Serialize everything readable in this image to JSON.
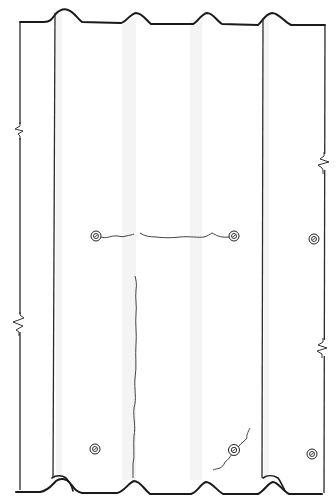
{
  "drawing": {
    "type": "corrugated sheet panel elevation",
    "colors": {
      "line": "#1a1a1a",
      "crack": "#444444",
      "shade": "#f4f4f4",
      "background": "#ffffff"
    },
    "panels": [
      {
        "name": "left-panel-edge",
        "x_left": 20,
        "x_right": 55
      },
      {
        "name": "center-panel",
        "x_left": 55,
        "x_right": 263
      },
      {
        "name": "right-panel-edge",
        "x_left": 263,
        "x_right": 325
      }
    ],
    "corrugation_crests_top": [
      60,
      138,
      206,
      272
    ],
    "corrugation_crests_bottom": [
      62,
      134,
      204,
      272
    ],
    "break_lines": [
      {
        "side": "left",
        "y": 130
      },
      {
        "side": "left",
        "y": 322
      },
      {
        "side": "right",
        "y": 162
      },
      {
        "side": "right",
        "y": 348
      }
    ],
    "fasteners": [
      {
        "id": "f1",
        "x": 96,
        "y": 236
      },
      {
        "id": "f2",
        "x": 234,
        "y": 236
      },
      {
        "id": "f3",
        "x": 314,
        "y": 239
      },
      {
        "id": "f4",
        "x": 95,
        "y": 449
      },
      {
        "id": "f5",
        "x": 234,
        "y": 450
      },
      {
        "id": "f6",
        "x": 312,
        "y": 454
      }
    ],
    "cracks": [
      {
        "id": "horizontal-crack",
        "description": "crack running between upper fasteners"
      },
      {
        "id": "vertical-crack",
        "description": "long vertical crack in center panel"
      },
      {
        "id": "diagonal-crack",
        "description": "diagonal crack through lower right fastener"
      }
    ]
  }
}
